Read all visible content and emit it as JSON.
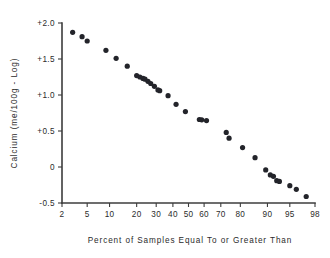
{
  "chart_data": {
    "type": "scatter",
    "title": "",
    "subtitle": "",
    "xlabel": "Percent of Samples Equal To or Greater Than",
    "ylabel": "Calcium (me/100g - Log)",
    "x_scale": "probability",
    "xlim": [
      2,
      98
    ],
    "ylim": [
      -0.6,
      2.05
    ],
    "grid": false,
    "legend": null,
    "x_tick_labels": [
      "2",
      "5",
      "10",
      "20",
      "30",
      "40",
      "50",
      "60",
      "70",
      "80",
      "90",
      "95",
      "98"
    ],
    "x_tick_values": [
      2,
      5,
      10,
      20,
      30,
      40,
      50,
      60,
      70,
      80,
      90,
      95,
      98
    ],
    "y_tick_labels": [
      "+2.0",
      "+1.5",
      "+1.0",
      "+0.5",
      "0",
      "-0.5"
    ],
    "y_tick_values": [
      2.0,
      1.5,
      1.0,
      0.5,
      0,
      -0.5
    ],
    "marker": "filled-circle",
    "marker_color": "#23242a",
    "marker_size": 2.6,
    "points": [
      {
        "x": 3.0,
        "y": 1.87
      },
      {
        "x": 4.2,
        "y": 1.81
      },
      {
        "x": 5.0,
        "y": 1.75
      },
      {
        "x": 9.0,
        "y": 1.62
      },
      {
        "x": 12.0,
        "y": 1.51
      },
      {
        "x": 16.0,
        "y": 1.4
      },
      {
        "x": 20.0,
        "y": 1.27
      },
      {
        "x": 21.5,
        "y": 1.25
      },
      {
        "x": 23.0,
        "y": 1.23
      },
      {
        "x": 24.0,
        "y": 1.22
      },
      {
        "x": 25.5,
        "y": 1.19
      },
      {
        "x": 27.0,
        "y": 1.16
      },
      {
        "x": 29.0,
        "y": 1.12
      },
      {
        "x": 31.0,
        "y": 1.07
      },
      {
        "x": 32.0,
        "y": 1.06
      },
      {
        "x": 37.0,
        "y": 0.99
      },
      {
        "x": 42.0,
        "y": 0.87
      },
      {
        "x": 48.0,
        "y": 0.77
      },
      {
        "x": 57.0,
        "y": 0.66
      },
      {
        "x": 58.5,
        "y": 0.655
      },
      {
        "x": 61.5,
        "y": 0.645
      },
      {
        "x": 73.0,
        "y": 0.48
      },
      {
        "x": 74.5,
        "y": 0.4
      },
      {
        "x": 81.0,
        "y": 0.27
      },
      {
        "x": 86.0,
        "y": 0.13
      },
      {
        "x": 89.5,
        "y": -0.04
      },
      {
        "x": 90.8,
        "y": -0.11
      },
      {
        "x": 91.6,
        "y": -0.13
      },
      {
        "x": 92.4,
        "y": -0.19
      },
      {
        "x": 93.0,
        "y": -0.2
      },
      {
        "x": 95.0,
        "y": -0.26
      },
      {
        "x": 96.0,
        "y": -0.31
      },
      {
        "x": 97.2,
        "y": -0.41
      }
    ]
  },
  "geometry": {
    "plot_left": 62,
    "plot_right": 315,
    "plot_top": 23,
    "plot_bottom": 203
  }
}
